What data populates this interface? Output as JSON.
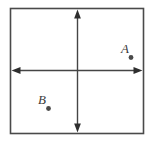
{
  "figure": {
    "colors": {
      "line": "#454545",
      "border": "#4a4a4a",
      "dot": "#4a4a4a",
      "label": "#3a3a3a",
      "background": "#ffffff"
    },
    "points": [
      {
        "label": "A",
        "quadrant": "upper-right"
      },
      {
        "label": "B",
        "quadrant": "lower-left"
      }
    ]
  }
}
